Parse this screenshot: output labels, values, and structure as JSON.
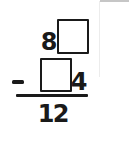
{
  "worksheet": {
    "problem": {
      "operator": "−",
      "minuend": {
        "tens": "8",
        "ones_blank": ""
      },
      "subtrahend": {
        "tens_blank": "",
        "ones": "4"
      },
      "difference": {
        "tens": "1",
        "ones": "2"
      }
    },
    "colors": {
      "ink": "#1a1a1a",
      "paper": "#ffffff",
      "scan_artifact_gray": "#c6c6c6"
    }
  }
}
